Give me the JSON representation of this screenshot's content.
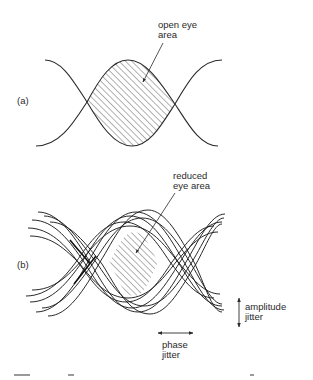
{
  "figure": {
    "panel_a": {
      "label": "(a)",
      "annotation_line1": "open eye",
      "annotation_line2": "area"
    },
    "panel_b": {
      "label": "(b)",
      "annotation_line1": "reduced",
      "annotation_line2": "eye area",
      "amplitude_jitter_line1": "amplitude",
      "amplitude_jitter_line2": "jitter",
      "phase_jitter_line1": "phase",
      "phase_jitter_line2": "jitter"
    }
  },
  "colors": {
    "stroke": "#2a2a2a",
    "hatch": "#555555",
    "background": "#ffffff"
  }
}
